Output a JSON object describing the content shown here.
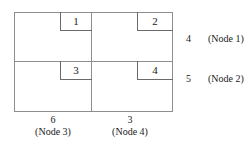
{
  "diagram": {
    "stroke_color": "#8d8d8d",
    "block_stroke_color": "#6a6a6a",
    "text_color": "#1a1a1a",
    "background_color": "#ffffff",
    "blocks": [
      {
        "label": "1",
        "quadrant": "top-left"
      },
      {
        "label": "2",
        "quadrant": "top-right"
      },
      {
        "label": "3",
        "quadrant": "bottom-left"
      },
      {
        "label": "4",
        "quadrant": "bottom-right"
      }
    ],
    "row_labels": [
      {
        "value": "4",
        "node": "(Node 1)"
      },
      {
        "value": "5",
        "node": "(Node 2)"
      }
    ],
    "column_labels": [
      {
        "value": "6",
        "node": "(Node 3)"
      },
      {
        "value": "3",
        "node": "(Node 4)"
      }
    ]
  }
}
